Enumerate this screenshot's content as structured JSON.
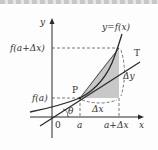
{
  "diagram": {
    "labels": {
      "y_axis": "y",
      "x_axis": "x",
      "origin": "0",
      "curve": "y=f(x)",
      "tangent": "T",
      "point": "P",
      "f_a": "f(a)",
      "f_a_dx": "f(a+Δx)",
      "a": "a",
      "a_dx": "a+Δx",
      "dx": "Δx",
      "dy": "Δy",
      "theta": "θ"
    },
    "colors": {
      "line": "#2a2a2a",
      "shade": "#c8c8c8",
      "dash": "#555555",
      "text": "#333333"
    }
  }
}
